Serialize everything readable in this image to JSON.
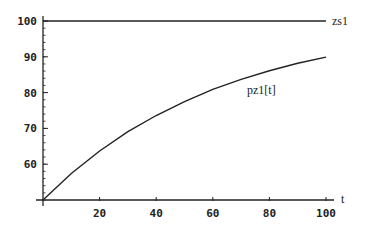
{
  "chart_data": {
    "type": "line",
    "title": "",
    "xlabel": "t",
    "ylabel": "",
    "xlim": [
      0,
      100
    ],
    "ylim": [
      50,
      100
    ],
    "x_ticks": [
      20,
      40,
      60,
      80,
      100
    ],
    "y_ticks": [
      60,
      70,
      80,
      90,
      100
    ],
    "grid": false,
    "legend": "inline labels",
    "series": [
      {
        "name": "zs1",
        "x": [
          0,
          100
        ],
        "values": [
          100,
          100
        ]
      },
      {
        "name": "pz1[t]",
        "x": [
          0,
          10,
          20,
          30,
          40,
          50,
          60,
          70,
          80,
          90,
          100
        ],
        "values": [
          50,
          57.4,
          63.7,
          69.1,
          73.6,
          77.5,
          80.9,
          83.7,
          86.1,
          88.2,
          89.9
        ]
      }
    ]
  },
  "labels": {
    "x_axis": "t",
    "zs1": "zs1",
    "pz1": "pz1[t]",
    "x_ticks": [
      "20",
      "40",
      "60",
      "80",
      "100"
    ],
    "y_ticks": [
      "60",
      "70",
      "80",
      "90",
      "100"
    ]
  }
}
